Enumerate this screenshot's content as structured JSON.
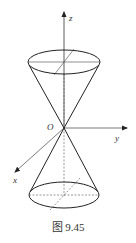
{
  "figure": {
    "caption": "图 9.45",
    "caption_prefix": "图",
    "caption_number": "9.45"
  },
  "axes": {
    "x_label": "x",
    "y_label": "y",
    "z_label": "z",
    "origin_label": "O"
  },
  "colors": {
    "stroke": "#222222",
    "axis": "#444444",
    "background": "#ffffff"
  }
}
